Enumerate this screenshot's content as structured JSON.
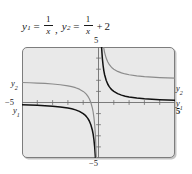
{
  "figure": {
    "caption": {
      "equation_1": {
        "lhs": "y",
        "lhs_sub": "1",
        "equals": "=",
        "numerator": "1",
        "denominator": "x",
        "separator": ","
      },
      "equation_2": {
        "lhs": "y",
        "lhs_sub": "2",
        "equals": "=",
        "numerator": "1",
        "denominator": "x",
        "plus": "+",
        "constant": "2"
      }
    },
    "labels": {
      "top": "5",
      "bottom": "−5",
      "left": "−5",
      "right": "5",
      "y1_left": "y",
      "y1_left_sub": "1",
      "y2_left": "y",
      "y2_left_sub": "2",
      "y1_right": "y",
      "y1_right_sub": "1",
      "y2_right": "y",
      "y2_right_sub": "2"
    },
    "colors": {
      "panel_background": "#e9e9e9",
      "panel_border": "#7d7d7d",
      "page_background": "#ffffff",
      "axis": "#6e6e6e",
      "curve_y1": "#111111",
      "curve_y2": "#8c8c8c",
      "text": "#1a1a1a"
    }
  },
  "chart_data": {
    "type": "line",
    "title": "",
    "xlabel": "",
    "ylabel": "",
    "xlim": [
      -5,
      5
    ],
    "ylim": [
      -5,
      5
    ],
    "grid": false,
    "ticks": {
      "x": [
        -4,
        -3,
        -2,
        -1,
        1,
        2,
        3,
        4
      ],
      "y": [
        -4,
        -3,
        -2,
        -1,
        1,
        2,
        3,
        4
      ],
      "tick_spacing": 1
    },
    "legend": {
      "position": "curve-endpoint-labels",
      "entries": [
        "y1",
        "y2"
      ]
    },
    "annotations": [
      {
        "text": "5",
        "position": "top-of-y-axis"
      },
      {
        "text": "-5",
        "position": "bottom-of-y-axis"
      },
      {
        "text": "-5",
        "position": "left-of-x-axis"
      },
      {
        "text": "5",
        "position": "right-of-x-axis"
      },
      {
        "text": "y2",
        "position": "left-branch-upper"
      },
      {
        "text": "y1",
        "position": "left-branch-lower"
      },
      {
        "text": "y2",
        "position": "right-branch-upper"
      },
      {
        "text": "y1",
        "position": "right-branch-lower"
      }
    ],
    "series": [
      {
        "name": "y1",
        "expression": "y = 1/x",
        "color": "#111111",
        "asymptotes": {
          "vertical": 0,
          "horizontal": 0
        },
        "branches": [
          {
            "name": "left",
            "points": [
              [
                -5,
                -0.2
              ],
              [
                -4.5,
                -0.222
              ],
              [
                -4,
                -0.25
              ],
              [
                -3.5,
                -0.286
              ],
              [
                -3,
                -0.333
              ],
              [
                -2.5,
                -0.4
              ],
              [
                -2,
                -0.5
              ],
              [
                -1.75,
                -0.571
              ],
              [
                -1.5,
                -0.667
              ],
              [
                -1.25,
                -0.8
              ],
              [
                -1,
                -1
              ],
              [
                -0.9,
                -1.111
              ],
              [
                -0.8,
                -1.25
              ],
              [
                -0.7,
                -1.429
              ],
              [
                -0.6,
                -1.667
              ],
              [
                -0.5,
                -2
              ],
              [
                -0.4,
                -2.5
              ],
              [
                -0.35,
                -2.857
              ],
              [
                -0.3,
                -3.333
              ],
              [
                -0.25,
                -4
              ],
              [
                -0.2,
                -5
              ]
            ]
          },
          {
            "name": "right",
            "points": [
              [
                0.2,
                5
              ],
              [
                0.25,
                4
              ],
              [
                0.3,
                3.333
              ],
              [
                0.35,
                2.857
              ],
              [
                0.4,
                2.5
              ],
              [
                0.5,
                2
              ],
              [
                0.6,
                1.667
              ],
              [
                0.7,
                1.429
              ],
              [
                0.8,
                1.25
              ],
              [
                0.9,
                1.111
              ],
              [
                1,
                1
              ],
              [
                1.25,
                0.8
              ],
              [
                1.5,
                0.667
              ],
              [
                1.75,
                0.571
              ],
              [
                2,
                0.5
              ],
              [
                2.5,
                0.4
              ],
              [
                3,
                0.333
              ],
              [
                3.5,
                0.286
              ],
              [
                4,
                0.25
              ],
              [
                4.5,
                0.222
              ],
              [
                5,
                0.2
              ]
            ]
          }
        ]
      },
      {
        "name": "y2",
        "expression": "y = 1/x + 2",
        "color": "#8c8c8c",
        "asymptotes": {
          "vertical": 0,
          "horizontal": 2
        },
        "branches": [
          {
            "name": "left",
            "points": [
              [
                -5,
                1.8
              ],
              [
                -4.5,
                1.778
              ],
              [
                -4,
                1.75
              ],
              [
                -3.5,
                1.714
              ],
              [
                -3,
                1.667
              ],
              [
                -2.5,
                1.6
              ],
              [
                -2,
                1.5
              ],
              [
                -1.75,
                1.429
              ],
              [
                -1.5,
                1.333
              ],
              [
                -1.25,
                1.2
              ],
              [
                -1,
                1
              ],
              [
                -0.9,
                0.889
              ],
              [
                -0.8,
                0.75
              ],
              [
                -0.7,
                0.571
              ],
              [
                -0.6,
                0.333
              ],
              [
                -0.5,
                0
              ],
              [
                -0.4,
                -0.5
              ],
              [
                -0.35,
                -0.857
              ],
              [
                -0.3,
                -1.333
              ],
              [
                -0.25,
                -2
              ],
              [
                -0.2,
                -3
              ],
              [
                -0.15,
                -4.667
              ],
              [
                -0.143,
                -5
              ]
            ]
          },
          {
            "name": "right",
            "points": [
              [
                0.143,
                9
              ],
              [
                0.2,
                7
              ],
              [
                0.25,
                6
              ],
              [
                0.3,
                5.333
              ],
              [
                0.333,
                5
              ],
              [
                0.4,
                4.5
              ],
              [
                0.5,
                4
              ],
              [
                0.6,
                3.667
              ],
              [
                0.7,
                3.429
              ],
              [
                0.8,
                3.25
              ],
              [
                0.9,
                3.111
              ],
              [
                1,
                3
              ],
              [
                1.25,
                2.8
              ],
              [
                1.5,
                2.667
              ],
              [
                1.75,
                2.571
              ],
              [
                2,
                2.5
              ],
              [
                2.5,
                2.4
              ],
              [
                3,
                2.333
              ],
              [
                3.5,
                2.286
              ],
              [
                4,
                2.25
              ],
              [
                4.5,
                2.222
              ],
              [
                5,
                2.2
              ]
            ]
          }
        ]
      }
    ]
  }
}
